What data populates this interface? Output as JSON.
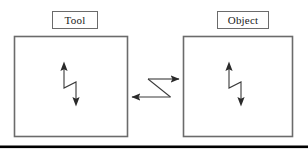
{
  "figure": {
    "kind": "block-diagram",
    "background_color": "#ffffff",
    "line_color": "#3a3a3a",
    "box_border_color": "#6b6b6b",
    "text_color": "#1a1a1a",
    "rule_color": "#000000",
    "labels": {
      "tool": "Tool",
      "object": "Object"
    },
    "nodes": [
      {
        "id": "tool",
        "label": "Tool",
        "box": {
          "x": 14,
          "y": 36,
          "width": 114,
          "height": 101
        },
        "label_box": {
          "x": 52,
          "y": 11,
          "width": 46,
          "height": 18
        },
        "inner_symbol": "double-headed-zigzag-arrow"
      },
      {
        "id": "object",
        "label": "Object",
        "box": {
          "x": 183,
          "y": 36,
          "width": 110,
          "height": 101
        },
        "label_box": {
          "x": 217,
          "y": 11,
          "width": 52,
          "height": 18
        },
        "inner_symbol": "double-headed-zigzag-arrow"
      }
    ],
    "connector": {
      "id": "tool-object-connector",
      "shape": "z-shaped-bidirectional",
      "arrow_to_object": {
        "from": [
          148,
          79
        ],
        "to": [
          183,
          79
        ],
        "direction": "right"
      },
      "diagonal": {
        "from": [
          148,
          79
        ],
        "to": [
          170,
          97
        ]
      },
      "arrow_to_tool": {
        "from": [
          170,
          97
        ],
        "to": [
          128,
          97
        ],
        "direction": "left"
      }
    },
    "bottom_rule": {
      "x": 0,
      "y": 146,
      "width": 308,
      "height": 3
    }
  }
}
